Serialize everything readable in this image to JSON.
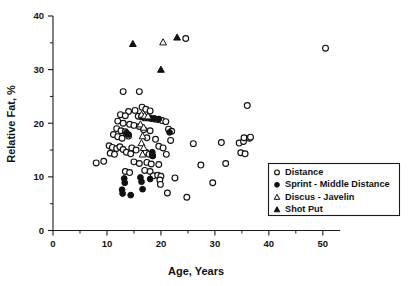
{
  "chart_data": {
    "type": "scatter",
    "title": "",
    "xlabel": "Age, Years",
    "ylabel": "Relative Fat, %",
    "xlim": [
      0,
      52
    ],
    "ylim": [
      0,
      40
    ],
    "xticks": [
      0,
      10,
      20,
      30,
      40,
      50
    ],
    "yticks": [
      0,
      10,
      20,
      30,
      40
    ],
    "xminor": [
      5,
      15,
      25,
      35,
      45
    ],
    "yminor": [
      5,
      15,
      25,
      35
    ],
    "grid": false,
    "legend_position": "bottom-right",
    "marker_color": "#111111",
    "series": [
      {
        "name": "Distance",
        "marker": "open-circle",
        "points": [
          [
            24.6,
            35.8
          ],
          [
            50.5,
            34.0
          ],
          [
            13.0,
            25.9
          ],
          [
            16.0,
            25.9
          ],
          [
            16.5,
            23.0
          ],
          [
            36.0,
            23.3
          ],
          [
            14.0,
            22.2
          ],
          [
            15.2,
            22.4
          ],
          [
            17.2,
            22.6
          ],
          [
            18.0,
            22.3
          ],
          [
            12.5,
            21.6
          ],
          [
            13.4,
            21.4
          ],
          [
            15.8,
            21.3
          ],
          [
            16.4,
            21.2
          ],
          [
            17.0,
            21.0
          ],
          [
            17.6,
            21.0
          ],
          [
            18.2,
            20.9
          ],
          [
            18.8,
            20.8
          ],
          [
            19.4,
            20.7
          ],
          [
            20.2,
            20.5
          ],
          [
            20.9,
            20.3
          ],
          [
            12.0,
            20.4
          ],
          [
            13.0,
            20.0
          ],
          [
            14.2,
            19.8
          ],
          [
            15.0,
            19.6
          ],
          [
            16.0,
            19.4
          ],
          [
            11.8,
            19.0
          ],
          [
            12.6,
            18.6
          ],
          [
            13.4,
            18.4
          ],
          [
            16.8,
            18.8
          ],
          [
            18.0,
            18.6
          ],
          [
            21.4,
            18.9
          ],
          [
            22.0,
            18.5
          ],
          [
            11.2,
            17.9
          ],
          [
            12.0,
            17.5
          ],
          [
            12.8,
            17.2
          ],
          [
            14.0,
            17.6
          ],
          [
            17.4,
            17.3
          ],
          [
            19.0,
            17.0
          ],
          [
            21.8,
            16.8
          ],
          [
            26.0,
            16.2
          ],
          [
            31.2,
            16.4
          ],
          [
            34.5,
            16.3
          ],
          [
            35.3,
            16.6
          ],
          [
            35.4,
            17.3
          ],
          [
            36.4,
            17.2
          ],
          [
            36.6,
            17.4
          ],
          [
            10.4,
            15.8
          ],
          [
            11.0,
            15.5
          ],
          [
            11.8,
            15.3
          ],
          [
            12.4,
            15.6
          ],
          [
            13.0,
            15.1
          ],
          [
            14.6,
            15.4
          ],
          [
            15.4,
            15.0
          ],
          [
            19.6,
            15.7
          ],
          [
            20.4,
            15.4
          ],
          [
            10.6,
            14.4
          ],
          [
            11.4,
            14.2
          ],
          [
            13.6,
            14.6
          ],
          [
            14.4,
            14.3
          ],
          [
            17.2,
            14.6
          ],
          [
            17.8,
            14.2
          ],
          [
            18.4,
            14.0
          ],
          [
            21.0,
            14.2
          ],
          [
            34.8,
            14.5
          ],
          [
            35.6,
            14.3
          ],
          [
            8.0,
            12.6
          ],
          [
            9.4,
            12.9
          ],
          [
            15.0,
            12.8
          ],
          [
            16.0,
            12.5
          ],
          [
            17.4,
            12.7
          ],
          [
            18.2,
            12.4
          ],
          [
            19.6,
            12.3
          ],
          [
            27.4,
            12.2
          ],
          [
            32.0,
            12.5
          ],
          [
            13.4,
            11.0
          ],
          [
            14.2,
            10.8
          ],
          [
            17.0,
            11.2
          ],
          [
            18.0,
            11.0
          ],
          [
            18.6,
            10.2
          ],
          [
            19.4,
            10.3
          ],
          [
            20.0,
            10.1
          ],
          [
            19.8,
            9.4
          ],
          [
            19.9,
            8.6
          ],
          [
            22.6,
            9.8
          ],
          [
            29.6,
            8.9
          ],
          [
            21.2,
            7.0
          ],
          [
            24.8,
            6.2
          ]
        ]
      },
      {
        "name": "Sprint - Middle Distance",
        "marker": "filled-circle",
        "points": [
          [
            16.6,
            21.2
          ],
          [
            17.4,
            21.1
          ],
          [
            18.0,
            21.0
          ],
          [
            18.8,
            20.9
          ],
          [
            19.6,
            20.8
          ],
          [
            13.6,
            18.2
          ],
          [
            14.0,
            17.9
          ],
          [
            21.6,
            18.3
          ],
          [
            18.4,
            14.6
          ],
          [
            18.5,
            13.9
          ],
          [
            13.2,
            9.7
          ],
          [
            13.3,
            8.9
          ],
          [
            16.2,
            9.9
          ],
          [
            16.4,
            9.1
          ],
          [
            18.0,
            9.6
          ],
          [
            16.6,
            7.7
          ],
          [
            12.8,
            7.6
          ],
          [
            12.9,
            6.9
          ],
          [
            14.4,
            6.6
          ]
        ]
      },
      {
        "name": "Discus - Javelin",
        "marker": "open-triangle",
        "points": [
          [
            20.4,
            35.1
          ],
          [
            16.4,
            21.6
          ],
          [
            17.0,
            21.4
          ],
          [
            17.6,
            21.3
          ],
          [
            16.2,
            19.8
          ],
          [
            16.8,
            19.2
          ],
          [
            16.6,
            17.6
          ],
          [
            16.4,
            16.3
          ],
          [
            16.8,
            15.4
          ],
          [
            16.6,
            14.2
          ]
        ]
      },
      {
        "name": "Shot Put",
        "marker": "filled-triangle",
        "points": [
          [
            23.0,
            36.0
          ],
          [
            14.8,
            34.8
          ],
          [
            20.0,
            30.0
          ]
        ]
      }
    ]
  },
  "axes": {
    "x_tick_labels": [
      "0",
      "10",
      "20",
      "30",
      "40",
      "50"
    ],
    "y_tick_labels": [
      "0",
      "10",
      "20",
      "30",
      "40"
    ],
    "x_axis_label": "Age, Years",
    "y_axis_label": "Relative Fat, %"
  },
  "legend": {
    "entries": [
      {
        "label": "Distance",
        "marker": "open-circle"
      },
      {
        "label": "Sprint - Middle Distance",
        "marker": "filled-circle"
      },
      {
        "label": "Discus - Javelin",
        "marker": "open-triangle"
      },
      {
        "label": "Shot Put",
        "marker": "filled-triangle"
      }
    ]
  }
}
